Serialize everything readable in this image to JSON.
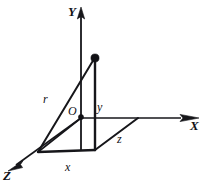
{
  "figure": {
    "background_color": "#ffffff",
    "ink_color": "#16161a",
    "width": 208,
    "height": 186
  },
  "axes": [
    {
      "key": "y_axis",
      "label": "Y",
      "direction": "up",
      "label_x": 68,
      "label_y": 5
    },
    {
      "key": "x_axis",
      "label": "X",
      "direction": "right",
      "label_x": 190,
      "label_y": 119
    },
    {
      "key": "z_axis",
      "label": "Z",
      "direction": "down-left",
      "label_x": 3,
      "label_y": 169
    }
  ],
  "origin": {
    "label": "O",
    "label_x": 68,
    "label_y": 105,
    "dot_x": 81,
    "dot_y": 117
  },
  "point": {
    "name": "position-point",
    "dot_x": 95,
    "dot_y": 58
  },
  "components": [
    {
      "key": "r",
      "label": "r",
      "label_x": 43,
      "label_y": 93,
      "description": "position vector from origin to point"
    },
    {
      "key": "y",
      "label": "y",
      "label_x": 97,
      "label_y": 101,
      "description": "vertical component along Y"
    },
    {
      "key": "x",
      "label": "x",
      "label_x": 65,
      "label_y": 161,
      "description": "component along X direction (front edge)"
    },
    {
      "key": "z",
      "label": "z",
      "label_x": 117,
      "label_y": 133,
      "description": "component along Z direction (diagonal edge)"
    }
  ],
  "geometry": {
    "origin": [
      81,
      117
    ],
    "point": [
      95,
      58
    ],
    "foot": [
      95,
      150
    ],
    "z_corner": [
      38,
      152
    ],
    "x_corner": [
      138,
      118
    ],
    "y_axis_top": [
      81,
      8
    ],
    "x_axis_end": [
      196,
      118
    ],
    "z_axis_end": [
      10,
      170
    ]
  }
}
